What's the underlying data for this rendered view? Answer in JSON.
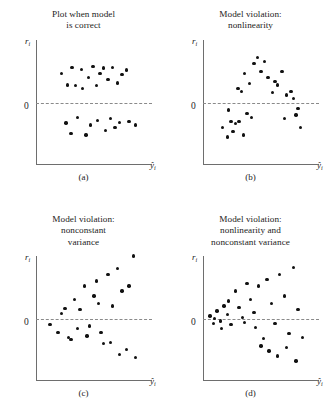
{
  "figure": {
    "y_axis_label": "r",
    "y_axis_sub": "i",
    "x_axis_label": "ŷ",
    "x_axis_sub": "i",
    "zero_label": "0"
  },
  "panels": [
    {
      "id": "a",
      "caption": "(a)",
      "title_lines": [
        "Plot when model",
        "is correct"
      ]
    },
    {
      "id": "b",
      "caption": "(b)",
      "title_lines": [
        "Model violation:",
        "nonlinearity"
      ]
    },
    {
      "id": "c",
      "caption": "(c)",
      "title_lines": [
        "Model violation:",
        "nonconstant",
        "variance"
      ]
    },
    {
      "id": "d",
      "caption": "(d)",
      "title_lines": [
        "Model violation:",
        "nonlinearity and",
        "nonconstant variance"
      ]
    }
  ],
  "chart_data": [
    {
      "type": "scatter",
      "panel": "a",
      "title": "Plot when model is correct",
      "xlabel": "y-hat_i",
      "ylabel": "r_i",
      "xlim": [
        0,
        1
      ],
      "ylim": [
        -1,
        1
      ],
      "grid": false,
      "legend": "none",
      "reference_line": {
        "type": "horizontal",
        "y": 0,
        "style": "dashed",
        "label": "0"
      },
      "annotations": [
        "Residuals scattered randomly in a horizontal band around zero"
      ],
      "x": [
        0.22,
        0.27,
        0.31,
        0.34,
        0.39,
        0.4,
        0.45,
        0.49,
        0.52,
        0.55,
        0.58,
        0.62,
        0.66,
        0.7,
        0.74,
        0.78,
        0.26,
        0.3,
        0.36,
        0.43,
        0.47,
        0.53,
        0.6,
        0.64,
        0.68,
        0.72,
        0.8,
        0.86
      ],
      "y": [
        0.46,
        0.28,
        0.56,
        0.27,
        0.53,
        0.22,
        0.4,
        0.58,
        0.27,
        0.46,
        0.55,
        0.37,
        0.56,
        0.31,
        0.45,
        0.52,
        -0.33,
        -0.5,
        -0.24,
        -0.52,
        -0.36,
        -0.29,
        -0.45,
        -0.26,
        -0.4,
        -0.32,
        -0.3,
        -0.36
      ]
    },
    {
      "type": "scatter",
      "panel": "b",
      "title": "Model violation: nonlinearity",
      "xlabel": "y-hat_i",
      "ylabel": "r_i",
      "xlim": [
        0,
        1
      ],
      "ylim": [
        -1,
        1
      ],
      "grid": false,
      "legend": "none",
      "reference_line": {
        "type": "horizontal",
        "y": 0,
        "style": "dashed",
        "label": "0"
      },
      "annotations": [
        "Residuals follow a curved (inverted-U) pattern indicating nonlinearity"
      ],
      "x": [
        0.17,
        0.21,
        0.24,
        0.28,
        0.3,
        0.33,
        0.36,
        0.4,
        0.44,
        0.47,
        0.5,
        0.53,
        0.56,
        0.6,
        0.64,
        0.68,
        0.72,
        0.76,
        0.8,
        0.84,
        0.22,
        0.26,
        0.31,
        0.35,
        0.38,
        0.42,
        0.62,
        0.7,
        0.78,
        0.82
      ],
      "y": [
        -0.4,
        -0.55,
        -0.3,
        -0.34,
        0.22,
        0.18,
        0.46,
        0.3,
        0.62,
        0.72,
        0.5,
        0.66,
        0.4,
        0.16,
        0.28,
        0.5,
        0.12,
        0.18,
        -0.2,
        -0.4,
        -0.12,
        -0.46,
        -0.3,
        -0.52,
        -0.18,
        -0.24,
        0.34,
        -0.26,
        0.06,
        -0.1
      ]
    },
    {
      "type": "scatter",
      "panel": "c",
      "title": "Model violation: nonconstant variance",
      "xlabel": "y-hat_i",
      "ylabel": "r_i",
      "xlim": [
        0,
        1
      ],
      "ylim": [
        -1,
        1
      ],
      "grid": false,
      "legend": "none",
      "reference_line": {
        "type": "horizontal",
        "y": 0,
        "style": "dashed",
        "label": "0"
      },
      "annotations": [
        "Residual spread fans out as fitted values increase"
      ],
      "x": [
        0.12,
        0.19,
        0.25,
        0.3,
        0.33,
        0.38,
        0.42,
        0.46,
        0.5,
        0.54,
        0.58,
        0.62,
        0.66,
        0.7,
        0.74,
        0.78,
        0.84,
        0.22,
        0.28,
        0.36,
        0.44,
        0.52,
        0.56,
        0.64,
        0.72,
        0.8,
        0.86
      ],
      "y": [
        -0.1,
        -0.22,
        0.16,
        -0.34,
        0.3,
        0.14,
        0.52,
        -0.12,
        0.36,
        0.24,
        -0.4,
        0.7,
        0.2,
        0.8,
        0.44,
        -0.5,
        1.0,
        0.08,
        -0.3,
        -0.16,
        -0.28,
        0.6,
        -0.22,
        -0.38,
        -0.58,
        0.52,
        -0.62
      ]
    },
    {
      "type": "scatter",
      "panel": "d",
      "title": "Model violation: nonlinearity and nonconstant variance",
      "xlabel": "y-hat_i",
      "ylabel": "r_i",
      "xlim": [
        0,
        1
      ],
      "ylim": [
        -1,
        1
      ],
      "grid": false,
      "legend": "none",
      "reference_line": {
        "type": "horizontal",
        "y": 0,
        "style": "dashed",
        "label": "0"
      },
      "annotations": [
        "Residuals show both curvature and increasing spread"
      ],
      "x": [
        0.06,
        0.09,
        0.12,
        0.15,
        0.18,
        0.21,
        0.24,
        0.28,
        0.31,
        0.34,
        0.38,
        0.41,
        0.45,
        0.48,
        0.52,
        0.55,
        0.59,
        0.62,
        0.66,
        0.7,
        0.74,
        0.78,
        0.82,
        0.1,
        0.16,
        0.22,
        0.36,
        0.44,
        0.5,
        0.57,
        0.64,
        0.72,
        0.8,
        0.86
      ],
      "y": [
        0.04,
        -0.08,
        0.12,
        -0.04,
        0.2,
        0.06,
        -0.1,
        0.44,
        0.18,
        0.02,
        0.56,
        0.3,
        -0.14,
        0.52,
        -0.32,
        0.62,
        0.24,
        -0.08,
        0.7,
        0.36,
        -0.24,
        0.82,
        0.14,
        0.0,
        -0.16,
        0.28,
        -0.06,
        0.1,
        -0.44,
        -0.52,
        -0.6,
        -0.46,
        -0.68,
        -0.3
      ]
    }
  ]
}
